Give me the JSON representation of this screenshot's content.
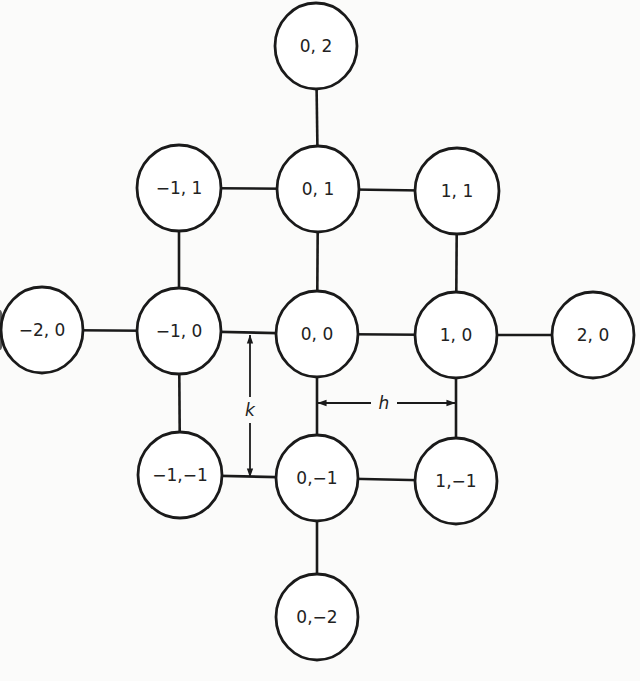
{
  "diagram": {
    "type": "grid-stencil",
    "colors": {
      "stroke": "#1a1a1a",
      "node_fill": "#ffffff",
      "text": "#222222",
      "background": "#fbfbfa"
    },
    "nodes": [
      {
        "id": "n_0_2",
        "label": "0, 2",
        "cx": 316,
        "cy": 46,
        "rx": 41,
        "ry": 43
      },
      {
        "id": "n_m1_1",
        "label": "−1, 1",
        "cx": 179,
        "cy": 188,
        "rx": 42,
        "ry": 43
      },
      {
        "id": "n_0_1",
        "label": "0, 1",
        "cx": 318,
        "cy": 189,
        "rx": 41,
        "ry": 43
      },
      {
        "id": "n_1_1",
        "label": "1, 1",
        "cx": 457,
        "cy": 191,
        "rx": 42,
        "ry": 43
      },
      {
        "id": "n_m2_0",
        "label": "−2, 0",
        "cx": 42,
        "cy": 330,
        "rx": 41,
        "ry": 43
      },
      {
        "id": "n_m1_0",
        "label": "−1, 0",
        "cx": 179,
        "cy": 331,
        "rx": 42,
        "ry": 43
      },
      {
        "id": "n_0_0",
        "label": "0, 0",
        "cx": 317,
        "cy": 334,
        "rx": 41,
        "ry": 43
      },
      {
        "id": "n_1_0",
        "label": "1, 0",
        "cx": 456,
        "cy": 335,
        "rx": 41,
        "ry": 43
      },
      {
        "id": "n_2_0",
        "label": "2, 0",
        "cx": 593,
        "cy": 335,
        "rx": 41,
        "ry": 43
      },
      {
        "id": "n_m1_m1",
        "label": "−1,−1",
        "cx": 180,
        "cy": 475,
        "rx": 42,
        "ry": 43
      },
      {
        "id": "n_0_m1",
        "label": "0,−1",
        "cx": 317,
        "cy": 478,
        "rx": 41,
        "ry": 43
      },
      {
        "id": "n_1_m1",
        "label": "1,−1",
        "cx": 456,
        "cy": 481,
        "rx": 41,
        "ry": 43
      },
      {
        "id": "n_0_m2",
        "label": "0,−2",
        "cx": 317,
        "cy": 617,
        "rx": 41,
        "ry": 43
      }
    ],
    "edges": [
      {
        "from": "n_0_2",
        "to": "n_0_1"
      },
      {
        "from": "n_m1_1",
        "to": "n_0_1"
      },
      {
        "from": "n_0_1",
        "to": "n_1_1"
      },
      {
        "from": "n_m1_1",
        "to": "n_m1_0"
      },
      {
        "from": "n_0_1",
        "to": "n_0_0"
      },
      {
        "from": "n_1_1",
        "to": "n_1_0"
      },
      {
        "from": "n_m2_0",
        "to": "n_m1_0"
      },
      {
        "from": "n_m1_0",
        "to": "n_0_0"
      },
      {
        "from": "n_0_0",
        "to": "n_1_0"
      },
      {
        "from": "n_1_0",
        "to": "n_2_0"
      },
      {
        "from": "n_m1_0",
        "to": "n_m1_m1"
      },
      {
        "from": "n_0_0",
        "to": "n_0_m1"
      },
      {
        "from": "n_1_0",
        "to": "n_1_m1"
      },
      {
        "from": "n_m1_m1",
        "to": "n_0_m1"
      },
      {
        "from": "n_0_m1",
        "to": "n_1_m1"
      },
      {
        "from": "n_0_m1",
        "to": "n_0_m2"
      }
    ],
    "dimensions": [
      {
        "id": "k",
        "label": "k",
        "orientation": "vertical",
        "x": 250,
        "y1": 335,
        "y2": 477,
        "label_x": 250,
        "label_y": 410,
        "meaning": "vertical grid spacing"
      },
      {
        "id": "h",
        "label": "h",
        "orientation": "horizontal",
        "y": 403,
        "x1": 318,
        "x2": 455,
        "label_x": 384,
        "label_y": 403,
        "meaning": "horizontal grid spacing"
      }
    ]
  }
}
